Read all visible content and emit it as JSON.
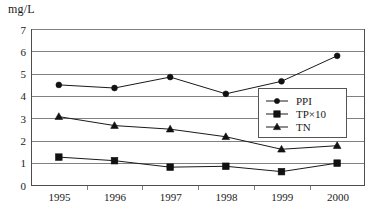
{
  "chart_data": {
    "type": "line",
    "title": "",
    "xlabel": "",
    "ylabel": "mg/L",
    "unit_label": "mg/L",
    "categories": [
      "1995",
      "1996",
      "1997",
      "1998",
      "1999",
      "2000"
    ],
    "ylim": [
      0,
      7
    ],
    "yticks": [
      "0",
      "1",
      "2",
      "3",
      "4",
      "5",
      "6",
      "7"
    ],
    "grid": true,
    "legend_position": "center-right",
    "series": [
      {
        "name": "PPI",
        "marker": "circle",
        "values": [
          4.5,
          4.36,
          4.85,
          4.1,
          4.66,
          5.8
        ]
      },
      {
        "name": "TP×10",
        "marker": "square",
        "values": [
          1.27,
          1.11,
          0.82,
          0.86,
          0.62,
          1.0
        ]
      },
      {
        "name": "TN",
        "marker": "triangle",
        "values": [
          3.08,
          2.68,
          2.52,
          2.18,
          1.62,
          1.78
        ]
      }
    ]
  },
  "legend": {
    "items": [
      {
        "label": "PPI",
        "marker": "circle"
      },
      {
        "label": "TP×10",
        "marker": "square"
      },
      {
        "label": "TN",
        "marker": "triangle"
      }
    ]
  },
  "axes": {
    "y_tick_0": "0",
    "y_tick_1": "1",
    "y_tick_2": "2",
    "y_tick_3": "3",
    "y_tick_4": "4",
    "y_tick_5": "5",
    "y_tick_6": "6",
    "y_tick_7": "7",
    "x_tick_0": "1995",
    "x_tick_1": "1996",
    "x_tick_2": "1997",
    "x_tick_3": "1998",
    "x_tick_4": "1999",
    "x_tick_5": "2000"
  }
}
